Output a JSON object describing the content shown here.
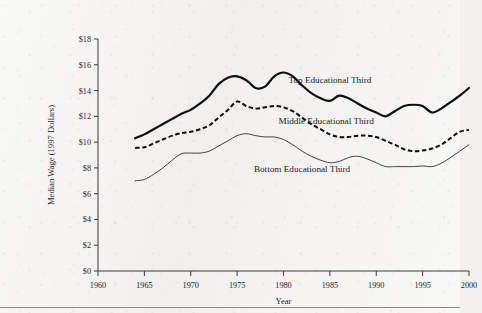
{
  "chart_data": {
    "type": "line",
    "title": "",
    "xlabel": "Year",
    "ylabel": "Median Wage (1997 Dollars)",
    "xlim": [
      1960,
      2000
    ],
    "ylim": [
      0,
      18
    ],
    "grid": false,
    "legend_position": "inline-annotations",
    "xticks": [
      "1960",
      "1965",
      "1970",
      "1975",
      "1980",
      "1985",
      "1990",
      "1995",
      "2000"
    ],
    "xtick_values": [
      1960,
      1965,
      1970,
      1975,
      1980,
      1985,
      1990,
      1995,
      2000
    ],
    "yticks": [
      "$0",
      "$2",
      "$4",
      "$6",
      "$8",
      "$10",
      "$12",
      "$14",
      "$16",
      "$18"
    ],
    "ytick_values": [
      0,
      2,
      4,
      6,
      8,
      10,
      12,
      14,
      16,
      18
    ],
    "x": [
      1964,
      1965,
      1966,
      1967,
      1968,
      1969,
      1970,
      1971,
      1972,
      1973,
      1974,
      1975,
      1976,
      1977,
      1978,
      1979,
      1980,
      1981,
      1982,
      1983,
      1984,
      1985,
      1986,
      1987,
      1988,
      1989,
      1990,
      1991,
      1992,
      1993,
      1994,
      1995,
      1996,
      1997,
      1998,
      1999,
      2000
    ],
    "series": [
      {
        "name": "Top Educational Third",
        "style": "solid-thick",
        "color": "#0d0d0d",
        "values": [
          10.3,
          10.6,
          11.0,
          11.4,
          11.8,
          12.2,
          12.5,
          13.0,
          13.6,
          14.5,
          15.0,
          15.1,
          14.8,
          14.2,
          14.3,
          15.1,
          15.4,
          15.1,
          14.4,
          13.8,
          13.4,
          13.2,
          13.6,
          13.4,
          13.0,
          12.6,
          12.3,
          12.0,
          12.4,
          12.8,
          12.9,
          12.8,
          12.3,
          12.6,
          13.1,
          13.6,
          14.2
        ]
      },
      {
        "name": "Middle Educational Third",
        "style": "dashed",
        "color": "#0d0d0d",
        "values": [
          9.55,
          9.6,
          9.9,
          10.2,
          10.5,
          10.7,
          10.8,
          11.0,
          11.3,
          11.9,
          12.5,
          13.15,
          12.8,
          12.6,
          12.7,
          12.8,
          12.7,
          12.4,
          11.9,
          11.4,
          11.0,
          10.6,
          10.4,
          10.4,
          10.5,
          10.5,
          10.4,
          10.1,
          9.8,
          9.45,
          9.3,
          9.35,
          9.5,
          9.8,
          10.3,
          10.8,
          10.95
        ]
      },
      {
        "name": "Bottom Educational Third",
        "style": "solid-thin",
        "color": "#2e2e2e",
        "values": [
          7.0,
          7.1,
          7.5,
          8.0,
          8.6,
          9.1,
          9.15,
          9.15,
          9.3,
          9.7,
          10.1,
          10.5,
          10.65,
          10.5,
          10.4,
          10.4,
          10.2,
          9.8,
          9.3,
          8.9,
          8.6,
          8.4,
          8.5,
          8.8,
          8.9,
          8.7,
          8.4,
          8.1,
          8.1,
          8.1,
          8.1,
          8.15,
          8.1,
          8.35,
          8.8,
          9.3,
          9.8
        ]
      }
    ],
    "annotations": [
      {
        "text": "Top Educational Third",
        "x": 1985.0,
        "y": 14.55
      },
      {
        "text": "Middle Educational Third",
        "x": 1984.6,
        "y": 11.4
      },
      {
        "text": "Bottom Educational Third",
        "x": 1982.0,
        "y": 7.65
      }
    ]
  }
}
